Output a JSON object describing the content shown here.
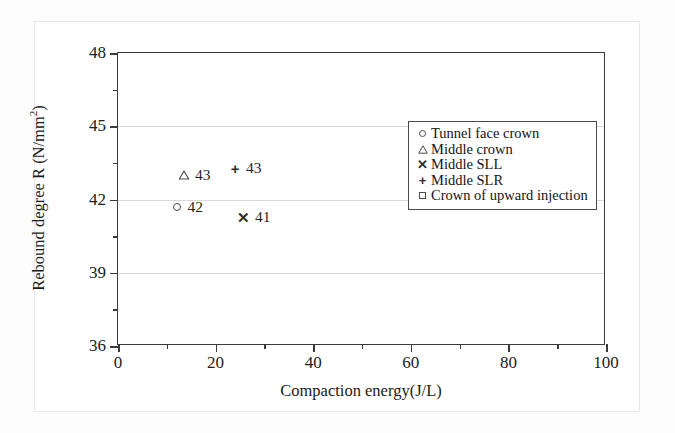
{
  "chart_data": {
    "type": "scatter",
    "title": "",
    "xlabel": "Compaction energy(J/L)",
    "ylabel": "Rebound degree R (N/mm2)",
    "ylabel_base": "Rebound degree R (N/mm",
    "ylabel_sup": "2",
    "ylabel_tail": ")",
    "xlim": [
      0,
      100
    ],
    "ylim": [
      36,
      48
    ],
    "xticks": [
      0,
      20,
      40,
      60,
      80,
      100
    ],
    "xtick_labels": [
      "0",
      "20",
      "40",
      "60",
      "80",
      "100"
    ],
    "xminor_ticks": [
      10,
      30,
      50,
      70,
      90
    ],
    "yticks": [
      36,
      39,
      42,
      45,
      48
    ],
    "ytick_labels": [
      "36",
      "39",
      "42",
      "45",
      "48"
    ],
    "yminor_ticks": [
      37.5,
      40.5,
      43.5,
      46.5
    ],
    "grid": "horizontal-major",
    "gridlines_y": [
      39,
      42,
      45
    ],
    "legend_position": "upper-right-inside",
    "series": [
      {
        "name": "Tunnel face crown",
        "marker": "circle-open",
        "x": [
          12.0
        ],
        "y": [
          41.7
        ],
        "labels": [
          "42"
        ]
      },
      {
        "name": "Middle crown",
        "marker": "triangle-open",
        "x": [
          13.5
        ],
        "y": [
          43.0
        ],
        "labels": [
          "43"
        ]
      },
      {
        "name": "Middle SLL",
        "marker": "x-cross",
        "x": [
          25.8
        ],
        "y": [
          41.3
        ],
        "labels": [
          "41"
        ]
      },
      {
        "name": "Middle SLR",
        "marker": "plus",
        "x": [
          24.0
        ],
        "y": [
          43.3
        ],
        "labels": [
          "43"
        ]
      },
      {
        "name": "Crown of upward injection",
        "marker": "square-open",
        "x": [
          77.0
        ],
        "y": [
          43.5
        ],
        "labels": [
          "44"
        ]
      }
    ]
  },
  "legend": {
    "items": [
      {
        "label": "Tunnel face crown",
        "marker": "circle-open",
        "glyph": ""
      },
      {
        "label": "Middle crown",
        "marker": "triangle-open",
        "glyph": ""
      },
      {
        "label": "Middle SLL",
        "marker": "x-cross",
        "glyph": "✕"
      },
      {
        "label": "Middle SLR",
        "marker": "plus",
        "glyph": "+"
      },
      {
        "label": "Crown of upward injection",
        "marker": "square-open",
        "glyph": ""
      }
    ]
  },
  "colors": {
    "axis": "#3b3b3b",
    "grid": "#d9d9d9",
    "marker": "#4a4a4a",
    "text": "#1a1a1a",
    "page_background": "#ffffff"
  }
}
